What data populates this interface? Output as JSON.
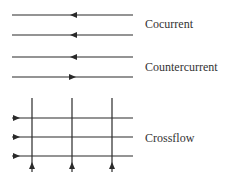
{
  "labels": {
    "cocurrent": "Cocurrent",
    "countercurrent": "Countercurrent",
    "crossflow": "Crossflow"
  },
  "colors": {
    "line": "#2a2a2a",
    "text": "#333333"
  },
  "diagram": {
    "cocurrent": [
      {
        "y": 15,
        "direction": "left"
      },
      {
        "y": 35,
        "direction": "left"
      }
    ],
    "countercurrent": [
      {
        "y": 57,
        "direction": "left"
      },
      {
        "y": 77,
        "direction": "right"
      }
    ],
    "crossflow": {
      "horizontal_y": [
        118,
        137,
        156
      ],
      "vertical_x": [
        32,
        72,
        112
      ],
      "horizontal_direction": "right",
      "vertical_direction": "up"
    }
  }
}
